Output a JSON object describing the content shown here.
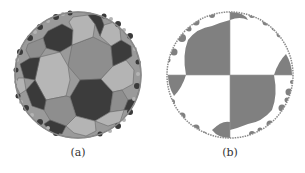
{
  "figure": {
    "panels": [
      {
        "id": "a",
        "caption": "(a)",
        "description": "Hyperbolic tiling of the Poincaré disk by heptagons, shaded in three gray tones",
        "colors": {
          "dark": "#3a3a3a",
          "mid": "#8a8a8a",
          "light": "#b4b4b4",
          "edge": "#666666"
        }
      },
      {
        "id": "b",
        "caption": "(b)",
        "description": "Poincaré disk checkerboard tiling with horocycle-like circles along the boundary, gray and white",
        "colors": {
          "fill": "#7f7f7f",
          "background": "#ffffff",
          "edge": "#888888"
        }
      }
    ]
  }
}
